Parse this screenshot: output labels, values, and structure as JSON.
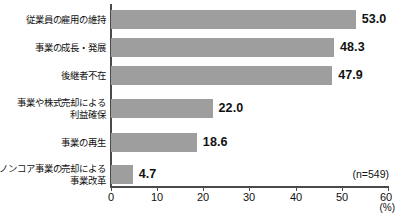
{
  "chart_data": {
    "type": "bar",
    "orientation": "horizontal",
    "title": "",
    "subtitle": "",
    "xlabel": "(%)",
    "ylabel": "",
    "xlim": [
      0,
      60
    ],
    "xticks": [
      "0",
      "10",
      "20",
      "30",
      "40",
      "50",
      "60"
    ],
    "grid": false,
    "legend": null,
    "categories": [
      "従業員の雇用の維持",
      "事業の成長・発展",
      "後継者不在",
      "事業や株式売却による\n利益確保",
      "事業の再生",
      "ノンコア事業の売却による\n事業改革"
    ],
    "values": [
      53.0,
      48.3,
      47.9,
      22.0,
      18.6,
      4.7
    ],
    "value_labels": [
      "53.0",
      "48.3",
      "47.9",
      "22.0",
      "18.6",
      "4.7"
    ],
    "annotations": {
      "sample_size": "(n=549)",
      "unit": "(%)"
    },
    "colors": {
      "bar": "#9e9e9e",
      "axis": "#4a4a4a",
      "text": "#111111",
      "background": "#ffffff"
    }
  },
  "footer": {
    "source_note": ""
  }
}
